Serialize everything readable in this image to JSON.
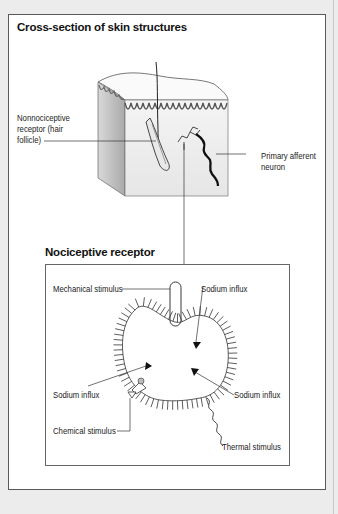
{
  "figure": {
    "top_panel": {
      "title": "Cross-section of skin structures",
      "labels": {
        "nonnociceptive_line1": "Nonnociceptive",
        "nonnociceptive_line2": "receptor (hair",
        "nonnociceptive_line3": "follicle)",
        "afferent_line1": "Primary afferent",
        "afferent_line2": "neuron"
      }
    },
    "bottom_panel": {
      "title": "Nociceptive receptor",
      "labels": {
        "mechanical": "Mechanical stimulus",
        "sodium_top": "Sodium influx",
        "sodium_left": "Sodium influx",
        "sodium_right": "Sodium influx",
        "chemical": "Chemical stimulus",
        "thermal": "Thermal stimulus"
      }
    }
  },
  "colors": {
    "page_background": "#ececec",
    "frame_border": "#5a5a5a",
    "panel_background": "#ffffff",
    "ink": "#111111"
  }
}
